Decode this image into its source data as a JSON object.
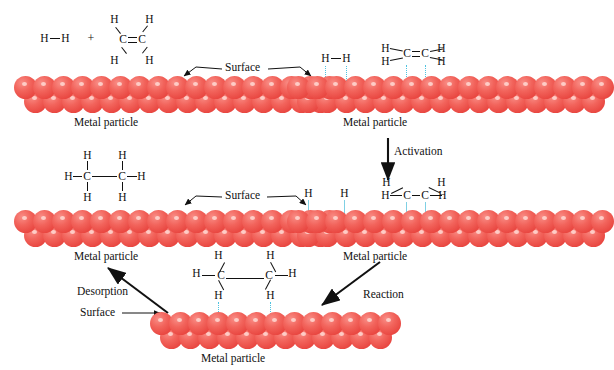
{
  "diagram": {
    "colors": {
      "metal_atom": "#ef5350",
      "metal_atom_dark": "#d93a34",
      "adsorption_bond": "#4ec3e0",
      "text": "#111111",
      "background": "#ffffff"
    },
    "labels": {
      "metal_particle": "Metal particle",
      "surface": "Surface",
      "plus": "+",
      "atom_h": "H",
      "atom_c": "C"
    },
    "steps": {
      "adsorption": "Adsorption",
      "activation": "Activation",
      "reaction": "Reaction",
      "desorption": "Desorption"
    },
    "stages": [
      {
        "id": "stage-1-reactants",
        "position": "top-left",
        "molecules": [
          "H-H",
          "H2C=CH2"
        ],
        "particle_label": "Metal particle",
        "surface_label": "Surface",
        "description": "Hydrogen and ethylene approach the metal particle"
      },
      {
        "id": "stage-2-adsorbed",
        "position": "top-right",
        "molecules": [
          "H-H adsorbed",
          "H2C=CH2 adsorbed"
        ],
        "particle_label": "Metal particle",
        "surface_label": "Surface",
        "description": "Both reactants adsorb onto the metal surface"
      },
      {
        "id": "stage-3-activated",
        "position": "middle-right",
        "molecules": [
          "H atom",
          "H atom",
          "H2C-CH2 activated"
        ],
        "particle_label": "Metal particle",
        "description": "H-H bond breaks; ethylene pi bond weakens"
      },
      {
        "id": "stage-4-intermediate",
        "position": "bottom-center",
        "molecules": [
          "H3C-CH3 forming"
        ],
        "particle_label": "Metal particle",
        "surface_label": "Surface",
        "description": "Hydrogen atoms add across the carbons"
      },
      {
        "id": "stage-5-product",
        "position": "middle-left",
        "molecules": [
          "H3C-CH3 ethane"
        ],
        "particle_label": "Metal particle",
        "surface_label": "Surface",
        "description": "Ethane desorbs from the surface"
      }
    ]
  }
}
